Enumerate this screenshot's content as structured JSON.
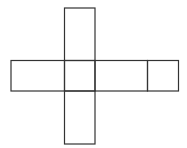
{
  "diagram": {
    "type": "cube-net",
    "stroke_color": "#333333",
    "background_color": "#ffffff",
    "stroke_width": 1.2,
    "faces": [
      {
        "id": "top",
        "x": 64.5,
        "y": 8,
        "w": 30.5,
        "h": 52.5
      },
      {
        "id": "left",
        "x": 11,
        "y": 60.5,
        "w": 53.5,
        "h": 30.5
      },
      {
        "id": "center",
        "x": 64.5,
        "y": 60.5,
        "w": 30.5,
        "h": 30.5
      },
      {
        "id": "right",
        "x": 95,
        "y": 60.5,
        "w": 52.5,
        "h": 30.5
      },
      {
        "id": "far-right",
        "x": 147.5,
        "y": 60.5,
        "w": 31,
        "h": 30.5
      },
      {
        "id": "bottom",
        "x": 64.5,
        "y": 91,
        "w": 30.5,
        "h": 53
      }
    ]
  }
}
